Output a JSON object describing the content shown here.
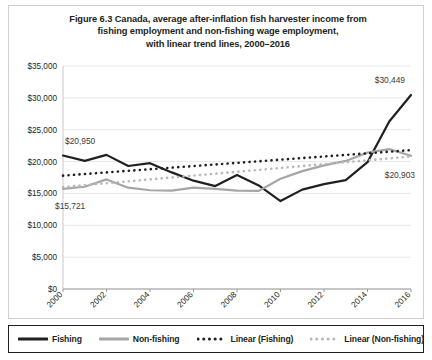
{
  "figure": {
    "title_lines": [
      "Figure 6.3 Canada, average after-inflation fish harvester income from",
      "fishing employment and non-fishing wage employment,",
      "with linear trend lines, 2000–2016"
    ]
  },
  "chart_data": {
    "type": "line",
    "title": "Figure 6.3 Canada, average after-inflation fish harvester income from fishing employment and non-fishing wage employment, with linear trend lines, 2000–2016",
    "xlabel": "",
    "ylabel": "",
    "grid": true,
    "legend_position": "bottom",
    "ylim": [
      0,
      35000
    ],
    "ytick_values": [
      0,
      5000,
      10000,
      15000,
      20000,
      25000,
      30000,
      35000
    ],
    "ytick_labels": [
      "$0",
      "$5,000",
      "$10,000",
      "$15,000",
      "$20,000",
      "$25,000",
      "$30,000",
      "$35,000"
    ],
    "x": [
      2000,
      2001,
      2002,
      2003,
      2004,
      2005,
      2006,
      2007,
      2008,
      2009,
      2010,
      2011,
      2012,
      2013,
      2014,
      2015,
      2016
    ],
    "xtick_labels": [
      "2000",
      "2002",
      "2004",
      "2006",
      "2008",
      "2010",
      "2012",
      "2014",
      "2016"
    ],
    "xtick_values": [
      2000,
      2002,
      2004,
      2006,
      2008,
      2010,
      2012,
      2014,
      2016
    ],
    "series": [
      {
        "name": "Fishing",
        "style": "solid",
        "color": "#231f20",
        "values": [
          20950,
          20100,
          21050,
          19300,
          19750,
          18300,
          17000,
          16150,
          17900,
          16250,
          13800,
          15600,
          16450,
          17100,
          19900,
          26300,
          30449
        ]
      },
      {
        "name": "Non-fishing",
        "style": "solid",
        "color": "#a6a6a6",
        "values": [
          15721,
          16050,
          17200,
          15900,
          15500,
          15450,
          15900,
          15700,
          15450,
          15400,
          17300,
          18500,
          19400,
          20100,
          21400,
          21950,
          20903
        ]
      },
      {
        "name": "Linear (Fishing)",
        "style": "dotted",
        "color": "#231f20",
        "values": [
          17800,
          18050,
          18300,
          18550,
          18800,
          19050,
          19300,
          19550,
          19800,
          20050,
          20300,
          20550,
          20800,
          21050,
          21300,
          21550,
          21800
        ]
      },
      {
        "name": "Linear (Non-fishing)",
        "style": "dotted",
        "color": "#b8b8b8",
        "values": [
          16000,
          16300,
          16600,
          16900,
          17200,
          17500,
          17800,
          18100,
          18400,
          18700,
          19000,
          19300,
          19600,
          19900,
          20200,
          20500,
          20800
        ]
      }
    ],
    "annotations": [
      {
        "text": "$20,950",
        "series": "Fishing",
        "x": 2000,
        "y": 20950
      },
      {
        "text": "$15,721",
        "series": "Non-fishing",
        "x": 2000,
        "y": 15721
      },
      {
        "text": "$30,449",
        "series": "Fishing",
        "x": 2016,
        "y": 30449
      },
      {
        "text": "$20,903",
        "series": "Non-fishing",
        "x": 2016,
        "y": 20903
      }
    ]
  },
  "legend": {
    "items": [
      {
        "label": "Fishing",
        "style": "solid",
        "color": "#231f20"
      },
      {
        "label": "Non-fishing",
        "style": "solid",
        "color": "#a6a6a6"
      },
      {
        "label": "Linear (Fishing)",
        "style": "dotted",
        "color": "#231f20"
      },
      {
        "label": "Linear (Non-fishing)",
        "style": "dotted",
        "color": "#b8b8b8"
      }
    ]
  },
  "colors": {
    "fishing": "#231f20",
    "non_fishing": "#a6a6a6",
    "trend_fishing": "#231f20",
    "trend_non_fishing": "#b8b8b8",
    "grid": "#e8e8e8",
    "frame": "#d0d0d0"
  }
}
